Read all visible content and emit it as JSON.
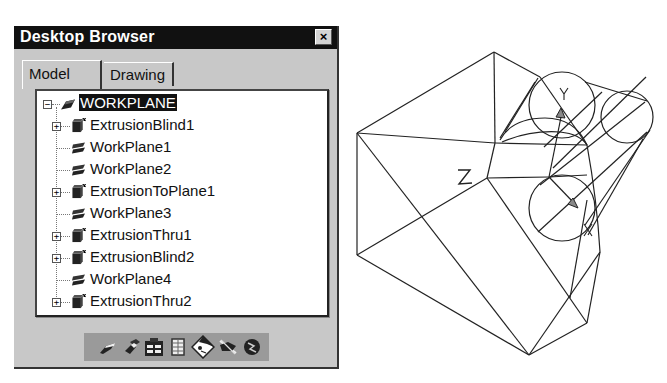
{
  "window": {
    "title": "Desktop Browser",
    "close_label": "×"
  },
  "tabs": [
    {
      "label": "Model",
      "active": true
    },
    {
      "label": "Drawing",
      "active": false
    }
  ],
  "tree": {
    "root": {
      "label": "WORKPLANE",
      "icon": "workplane-root-icon",
      "expanded": true,
      "selected": true
    },
    "children": [
      {
        "label": "ExtrusionBlind1",
        "icon": "extrusion-icon",
        "expandable": true
      },
      {
        "label": "WorkPlane1",
        "icon": "workplane-icon",
        "expandable": false
      },
      {
        "label": "WorkPlane2",
        "icon": "workplane-icon",
        "expandable": false
      },
      {
        "label": "ExtrusionToPlane1",
        "icon": "extrusion-icon",
        "expandable": true
      },
      {
        "label": "WorkPlane3",
        "icon": "workplane-icon",
        "expandable": false
      },
      {
        "label": "ExtrusionThru1",
        "icon": "extrusion-icon",
        "expandable": true
      },
      {
        "label": "ExtrusionBlind2",
        "icon": "extrusion-icon",
        "expandable": true
      },
      {
        "label": "WorkPlane4",
        "icon": "workplane-icon",
        "expandable": false
      },
      {
        "label": "ExtrusionThru2",
        "icon": "extrusion-icon",
        "expandable": true
      }
    ]
  },
  "toolbar": {
    "buttons": [
      {
        "name": "part-button",
        "icon": "part-icon"
      },
      {
        "name": "assembly-button",
        "icon": "assembly-icon"
      },
      {
        "name": "folder-button",
        "icon": "folder-icon"
      },
      {
        "name": "table-button",
        "icon": "table-icon"
      },
      {
        "name": "view-button",
        "icon": "view-diamond-icon"
      },
      {
        "name": "sketch-button",
        "icon": "sketch-icon"
      },
      {
        "name": "render-button",
        "icon": "render-icon"
      }
    ]
  },
  "viewport": {
    "axis_labels": {
      "z": "Z",
      "y": "Y",
      "x": "X"
    }
  }
}
